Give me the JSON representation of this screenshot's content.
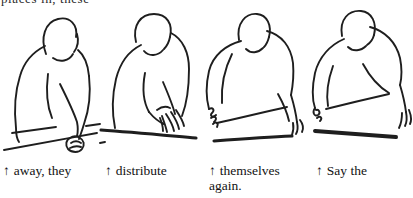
{
  "canvas": {
    "width": 413,
    "height": 198,
    "background": "#ffffff",
    "ink": "#1e1e1e"
  },
  "cropped_top_text": "places in, these",
  "panels": [
    {
      "figure": "person-hunched-over-table-fist-on-edge",
      "caption_arrow": "↑",
      "caption_text": "away, they"
    },
    {
      "figure": "person-leaning-hands-together-spreading",
      "caption_arrow": "↑",
      "caption_text": "distribute"
    },
    {
      "figure": "person-upright-right-arm-extended-on-table",
      "caption_arrow": "↑",
      "caption_text": "themselves again."
    },
    {
      "figure": "person-leaning-right-arm-sweep-open-hand",
      "caption_arrow": "↑",
      "caption_text": "Say the"
    }
  ]
}
